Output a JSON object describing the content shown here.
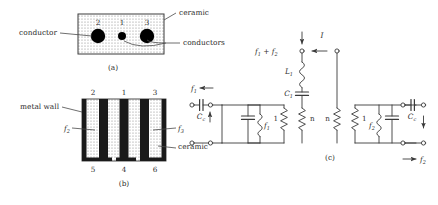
{
  "figure": {
    "panels": [
      {
        "caption": "(a)",
        "name": "cross-section-round-conductors",
        "labels": {
          "ceramic": "ceramic",
          "conductor": "conductor",
          "conductors": "conductors"
        },
        "conductor_numbers": [
          "2",
          "1",
          "3"
        ]
      },
      {
        "caption": "(b)",
        "name": "cross-section-strip-conductors",
        "labels": {
          "metal_wall": "metal wall",
          "ceramic": "ceramic",
          "f2": "f",
          "f2_sub": "2",
          "f3": "f",
          "f3_sub": "3"
        },
        "top_numbers": [
          "2",
          "1",
          "3"
        ],
        "bottom_numbers": [
          "5",
          "4",
          "6"
        ]
      },
      {
        "caption": "(c)",
        "name": "equivalent-circuit",
        "labels": {
          "sum_freq": "f",
          "sum_freq_sub1": "1",
          "sum_freq_plus": " + f",
          "sum_freq_sub2": "2",
          "current": "I",
          "L1": "L",
          "L1_sub": "1",
          "C1": "C",
          "C1_sub": "1",
          "Cc_left": "C",
          "Cc_left_sub": "c",
          "Cc_right": "C",
          "Cc_right_sub": "c",
          "f1": "f",
          "f1_sub": "1",
          "f2": "f",
          "f2_sub": "2",
          "f1_in": "f",
          "f1_in_sub": "1",
          "f2_out": "f",
          "f2_out_sub": "2",
          "turns_left": "1",
          "turns_n_left": "n",
          "turns_n_right": "n",
          "turns_right": "1"
        }
      }
    ],
    "colors": {
      "ink": "#2b2b2b",
      "line": "#4a4a4a",
      "conductor_fill": "#000000",
      "ceramic_fill": "#d9d9d9",
      "wall_fill": "#1a1a1a"
    }
  }
}
